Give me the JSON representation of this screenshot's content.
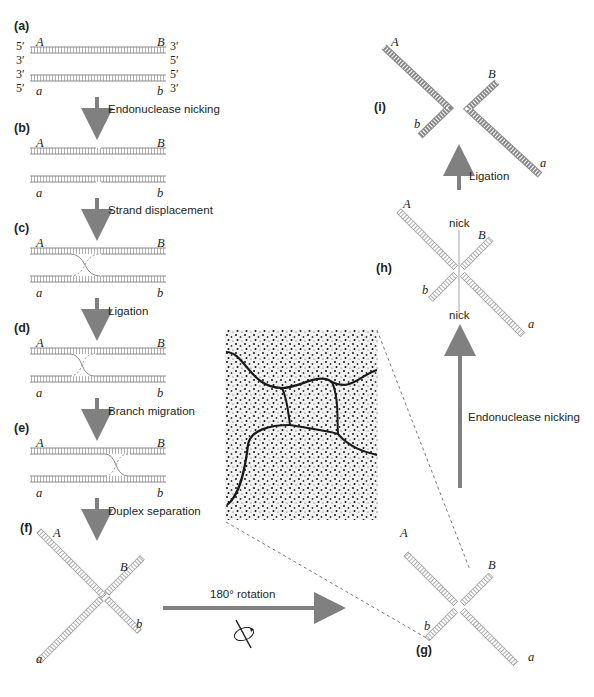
{
  "colors": {
    "arrow": "#808080",
    "strand": "#8a8a8a",
    "text": "#231f20",
    "dash": "#555555"
  },
  "panels": {
    "a": "(a)",
    "b": "(b)",
    "c": "(c)",
    "d": "(d)",
    "e": "(e)",
    "f": "(f)",
    "g": "(g)",
    "h": "(h)",
    "i": "(i)"
  },
  "strand_ends": {
    "five_prime": "5′",
    "three_prime": "3′"
  },
  "markers": {
    "A": "A",
    "B": "B",
    "a": "a",
    "b": "b"
  },
  "steps": {
    "a_to_b": "Endonuclease nicking",
    "b_to_c": "Strand displacement",
    "c_to_d": "Ligation",
    "d_to_e": "Branch migration",
    "e_to_f": "Duplex separation",
    "f_to_g": "180° rotation",
    "g_to_h": "Endonuclease nicking",
    "h_to_i": "Ligation"
  },
  "annotations": {
    "nick_top": "nick",
    "nick_bottom": "nick"
  },
  "micrograph": {
    "description": "electron micrograph of Holliday junction (chi form)"
  }
}
